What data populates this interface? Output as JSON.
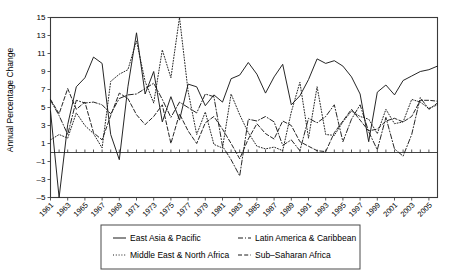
{
  "chart_data": {
    "type": "line",
    "title": "",
    "xlabel": "",
    "ylabel": "Annual Percentage Change",
    "ylim": [
      -5,
      15
    ],
    "ytick_step": 2,
    "yticks": [
      -5,
      -3,
      -1,
      1,
      3,
      5,
      7,
      9,
      11,
      13,
      15
    ],
    "xlim": [
      1961,
      2006
    ],
    "xticks": [
      1961,
      1963,
      1965,
      1967,
      1969,
      1971,
      1973,
      1975,
      1977,
      1979,
      1981,
      1983,
      1985,
      1987,
      1989,
      1991,
      1993,
      1995,
      1997,
      1999,
      2001,
      2003,
      2005
    ],
    "xtick_labels": [
      "1961",
      "1963",
      "1965",
      "1967",
      "1969",
      "1971",
      "1973",
      "1975",
      "1977",
      "1979",
      "1981",
      "1983",
      "1985",
      "1987",
      "1989",
      "1991",
      "1993",
      "1995",
      "1997",
      "1999",
      "2001",
      "2003",
      "2005"
    ],
    "grid": false,
    "legend_position": "bottom",
    "x": [
      1961,
      1962,
      1963,
      1964,
      1965,
      1966,
      1967,
      1968,
      1969,
      1970,
      1971,
      1972,
      1973,
      1974,
      1975,
      1976,
      1977,
      1978,
      1979,
      1980,
      1981,
      1982,
      1983,
      1984,
      1985,
      1986,
      1987,
      1988,
      1989,
      1990,
      1991,
      1992,
      1993,
      1994,
      1995,
      1996,
      1997,
      1998,
      1999,
      2000,
      2001,
      2002,
      2003,
      2004,
      2005,
      2006
    ],
    "series": [
      {
        "name": "East Asia & Pacific",
        "dash": "none",
        "values": [
          4.6,
          -5.4,
          3.1,
          7.3,
          8.3,
          10.6,
          9.9,
          2.0,
          -0.8,
          7.3,
          13.3,
          6.5,
          9.0,
          3.4,
          6.2,
          3.6,
          7.6,
          7.3,
          5.2,
          6.4,
          5.6,
          8.2,
          8.6,
          10.0,
          8.7,
          6.6,
          8.4,
          9.8,
          5.3,
          6.3,
          8.1,
          10.4,
          9.9,
          10.2,
          9.6,
          8.4,
          6.5,
          1.2,
          6.7,
          7.5,
          6.4,
          8.0,
          8.5,
          9.0,
          9.2,
          9.6
        ]
      },
      {
        "name": "Latin America & Caribbean",
        "dash": "dashdot",
        "values": [
          5.8,
          4.1,
          2.0,
          5.8,
          5.5,
          5.6,
          5.3,
          4.3,
          6.0,
          6.4,
          6.5,
          7.1,
          7.7,
          5.9,
          3.9,
          5.6,
          5.0,
          4.4,
          6.5,
          6.2,
          0.7,
          -0.8,
          -2.6,
          3.7,
          3.5,
          4.0,
          3.4,
          0.8,
          1.4,
          0.2,
          3.8,
          3.3,
          4.0,
          5.3,
          1.2,
          3.7,
          5.3,
          2.3,
          0.3,
          3.9,
          0.4,
          -0.4,
          2.0,
          6.1,
          4.8,
          5.5
        ]
      },
      {
        "name": "Middle East & North Africa",
        "dash": "dotted",
        "values": [
          1.4,
          2.0,
          1.6,
          4.4,
          3.0,
          2.1,
          0.5,
          7.9,
          8.7,
          9.2,
          12.4,
          7.9,
          5.5,
          11.4,
          8.3,
          15.0,
          6.8,
          2.0,
          4.5,
          0.9,
          0.5,
          6.5,
          4.2,
          2.2,
          0.7,
          0.4,
          0.6,
          0.2,
          4.5,
          7.8,
          1.6,
          7.3,
          2.0,
          1.9,
          3.4,
          4.6,
          4.0,
          3.7,
          2.1,
          4.8,
          3.2,
          3.4,
          5.9,
          5.6,
          4.9,
          5.3
        ]
      },
      {
        "name": "Sub-Saharan Africa",
        "dash": "dashed",
        "values": [
          5.9,
          4.3,
          7.1,
          4.8,
          5.6,
          2.2,
          1.4,
          4.1,
          6.6,
          6.0,
          4.2,
          3.1,
          4.0,
          5.3,
          1.0,
          4.3,
          2.4,
          1.0,
          3.3,
          4.0,
          2.6,
          1.0,
          -0.7,
          1.5,
          3.2,
          2.1,
          1.5,
          3.5,
          3.0,
          1.2,
          0.7,
          0.2,
          0.1,
          2.2,
          3.5,
          4.8,
          3.6,
          2.4,
          2.6,
          3.5,
          3.8,
          3.4,
          4.0,
          5.8,
          5.8,
          5.7
        ]
      }
    ],
    "legend_entries": [
      {
        "label": "East Asia & Pacific",
        "dash": "none"
      },
      {
        "label": "Latin America & Caribbean",
        "dash": "dashdot"
      },
      {
        "label": "Middle East & North Africa",
        "dash": "dotted"
      },
      {
        "label": "Sub-Saharan Africa",
        "dash": "dashed"
      }
    ]
  }
}
